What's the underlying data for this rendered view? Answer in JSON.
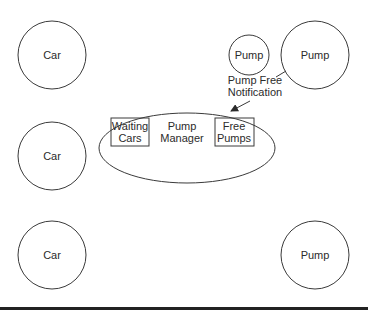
{
  "diagram": {
    "title": "",
    "nodes": {
      "car_top": {
        "label": "Car",
        "shape": "circle"
      },
      "car_mid": {
        "label": "Car",
        "shape": "circle"
      },
      "car_bottom": {
        "label": "Car",
        "shape": "circle"
      },
      "pump_small": {
        "label": "Pump",
        "shape": "circle"
      },
      "pump_top_right": {
        "label": "Pump",
        "shape": "circle"
      },
      "pump_bottom_right": {
        "label": "Pump",
        "shape": "circle"
      },
      "pump_manager": {
        "label_line1": "Pump",
        "label_line2": "Manager",
        "shape": "ellipse",
        "waiting_cars": {
          "line1": "Waiting",
          "line2": "Cars"
        },
        "free_pumps": {
          "line1": "Free",
          "line2": "Pumps"
        }
      }
    },
    "edges": [
      {
        "from": "pump_top_right",
        "to": "pump_manager",
        "label_line1": "Pump Free",
        "label_line2": "Notification",
        "arrow": true
      }
    ],
    "colors": {
      "stroke": "#3a3a3a",
      "text": "#2b2b2b",
      "background": "#ffffff",
      "bottom_bar": "#222222"
    }
  }
}
